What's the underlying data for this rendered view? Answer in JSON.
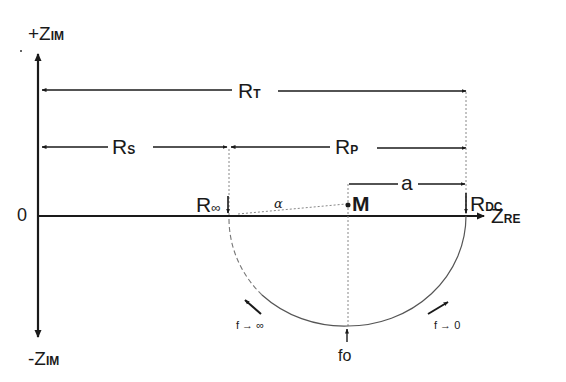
{
  "diagram": {
    "type": "nyquist-plot",
    "axes": {
      "y_positive": {
        "prefix": "+Z",
        "subscript": "IM"
      },
      "y_negative": {
        "prefix": "-Z",
        "subscript": "IM"
      },
      "x": {
        "prefix": "Z",
        "subscript": "RE"
      },
      "origin_label": "0"
    },
    "dimensions": {
      "r_total": {
        "main": "R",
        "subscript": "T"
      },
      "r_series": {
        "main": "R",
        "subscript": "S"
      },
      "r_parallel": {
        "main": "R",
        "subscript": "P"
      },
      "radius": "a"
    },
    "points": {
      "r_inf": {
        "main": "R",
        "subscript": "∞"
      },
      "r_dc": {
        "main": "R",
        "subscript": "DC"
      },
      "center": "M",
      "angle": "α",
      "f0": "fo"
    },
    "frequency_annotations": {
      "high": "f → ∞",
      "low": "f → 0"
    },
    "colors": {
      "ink": "#1a1a1a",
      "arc": "#555555",
      "dotted": "#777777"
    }
  }
}
